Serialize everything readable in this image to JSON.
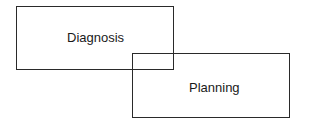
{
  "diagram": {
    "nodes": [
      {
        "id": "diagnosis",
        "label": "Diagnosis"
      },
      {
        "id": "planning",
        "label": "Planning"
      }
    ],
    "relation": "overlap",
    "colors": {
      "stroke": "#2a2a2a",
      "text": "#1a1a1a",
      "background": "#ffffff"
    }
  }
}
